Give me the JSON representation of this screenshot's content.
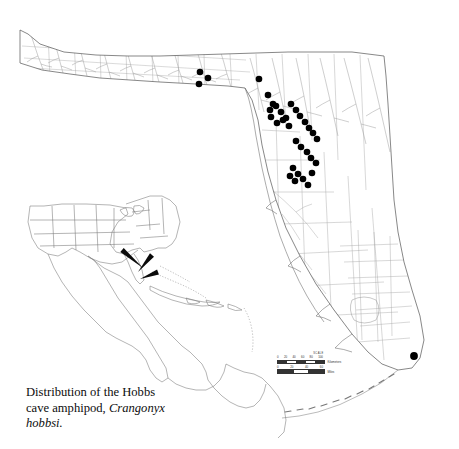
{
  "figure": {
    "kind": "species-distribution-map",
    "region_label": "Florida",
    "background_color": "#ffffff",
    "line_color": "#8a8a8a",
    "coast_color": "#4a4a4a",
    "dot_color": "#000000",
    "caption": {
      "line1": "Distribution of the Hobbs",
      "line2": "cave amphipod, ",
      "species": "Crangonyx",
      "line3": "hobbsi."
    }
  },
  "scale": {
    "title": "SCALE",
    "km_ticks": [
      "0",
      "20",
      "40",
      "60",
      "80",
      "100"
    ],
    "km_unit": "Kilometers",
    "mi_ticks": [
      "0",
      "20",
      "40",
      "60"
    ],
    "mi_unit": "Miles"
  },
  "inset": {
    "name": "north-central-america-locator",
    "arrow_count": 3,
    "arrows": [
      {
        "x1": 122,
        "y1": 250,
        "x2": 143,
        "y2": 268
      },
      {
        "x1": 152,
        "y1": 255,
        "x2": 138,
        "y2": 272
      },
      {
        "x1": 158,
        "y1": 272,
        "x2": 140,
        "y2": 279
      }
    ]
  },
  "chart_data": {
    "type": "scatter",
    "title": "Distribution of the Hobbs cave amphipod, Crangonyx hobbsi.",
    "xlabel": "",
    "ylabel": "",
    "x": [
      200,
      208,
      199,
      259,
      268,
      273,
      270,
      276,
      281,
      286,
      291,
      296,
      300,
      305,
      309,
      313,
      317,
      283,
      289,
      271,
      277,
      296,
      301,
      307,
      311,
      316,
      293,
      298,
      303,
      308,
      290,
      295,
      312,
      414
    ],
    "y": [
      72,
      78,
      84,
      79,
      95,
      104,
      110,
      106,
      112,
      118,
      104,
      110,
      116,
      122,
      128,
      133,
      139,
      120,
      126,
      117,
      123,
      141,
      147,
      152,
      158,
      163,
      168,
      174,
      179,
      185,
      176,
      181,
      173,
      356
    ],
    "marker": "filled-circle",
    "marker_color": "#000000",
    "marker_size": 7,
    "legend": []
  }
}
